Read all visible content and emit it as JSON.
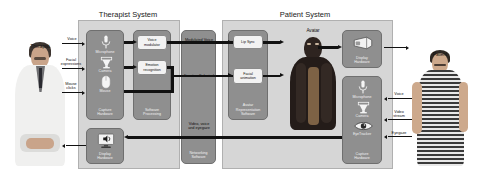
{
  "diagram": {
    "systems": [
      {
        "id": "therapist-system",
        "label": "Therapist System"
      },
      {
        "id": "patient-system",
        "label": "Patient System"
      }
    ],
    "actors": [
      {
        "id": "therapist",
        "label": "Therapist"
      },
      {
        "id": "patient",
        "label": "Patient"
      },
      {
        "id": "avatar",
        "label": "Avatar"
      }
    ],
    "therapist_system": {
      "capture_hardware": {
        "label": "Capture\nHardware",
        "devices": [
          {
            "icon": "microphone-icon",
            "label": "Microphone"
          },
          {
            "icon": "camera-icon",
            "label": "Camera"
          },
          {
            "icon": "mouse-icon",
            "label": "Mouse"
          }
        ]
      },
      "software_processing": {
        "label": "Software\nProcessing",
        "modules": [
          {
            "id": "voice-modulator",
            "label": "Voice\nmodulator"
          },
          {
            "id": "emotion-recognition",
            "label": "Emotion\nrecognition"
          }
        ]
      },
      "display_hardware": {
        "label": "Display\nHardware",
        "icon": "monitor-speaker-icon"
      }
    },
    "networking": {
      "label": "Networking\nSoftware",
      "channels": [
        {
          "id": "modulated-voice",
          "label": "Modulated Voice"
        },
        {
          "id": "emotion-selected",
          "label": "Emotion Selected"
        },
        {
          "id": "video-voice-eyegaze",
          "label": "Video, voice\nand eyegaze"
        }
      ]
    },
    "patient_system": {
      "avatar_software": {
        "label": "Avatar\nRepresentation\nSoftware",
        "modules": [
          {
            "id": "lip-sync",
            "label": "Lip Sync"
          },
          {
            "id": "facial-animation",
            "label": "Facial\nanimation"
          }
        ]
      },
      "display_hardware": {
        "label": "Display\nHardware",
        "icon": "hmd-icon"
      },
      "capture_hardware": {
        "label": "Capture\nHardware",
        "devices": [
          {
            "icon": "microphone-icon",
            "label": "Microphone"
          },
          {
            "icon": "camera-icon",
            "label": "Camera"
          },
          {
            "icon": "eye-icon",
            "label": "EyeTracker"
          }
        ]
      }
    },
    "therapist_inputs": [
      {
        "id": "voice",
        "label": "Voice"
      },
      {
        "id": "facial-expressions",
        "label": "Facial\nexpressions"
      },
      {
        "id": "mouse-clicks",
        "label": "Mouse\nclicks"
      }
    ],
    "patient_inputs": [
      {
        "id": "voice",
        "label": "Voice"
      },
      {
        "id": "video-stream",
        "label": "Video\nstream"
      },
      {
        "id": "eyegaze",
        "label": "Eyegaze"
      }
    ],
    "colors": {
      "system_fill": "#d6d6d6",
      "module_fill": "#8f8f8f",
      "submodule_fill": "#f2f2f2",
      "arrow": "#111111",
      "text_light": "#f2f2f2",
      "text_dark": "#111111"
    }
  }
}
